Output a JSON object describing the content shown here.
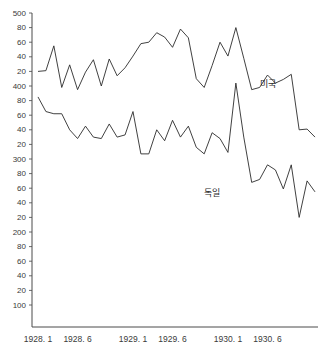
{
  "chart_data": {
    "type": "line",
    "title": "",
    "subtitle": "",
    "xlabel": "",
    "ylabel": "",
    "ylim": [
      100,
      500
    ],
    "xlim": [
      "1928.1",
      "1930.12"
    ],
    "grid": false,
    "legend_position": "inline-annotation",
    "y_ticks": [
      500,
      480,
      460,
      440,
      420,
      400,
      380,
      360,
      340,
      320,
      300,
      280,
      260,
      240,
      220,
      200,
      180,
      160,
      140,
      120,
      100
    ],
    "y_tick_labels": [
      "500",
      "80",
      "60",
      "40",
      "20",
      "400",
      "80",
      "60",
      "40",
      "20",
      "300",
      "80",
      "60",
      "40",
      "20",
      "200",
      "80",
      "60",
      "40",
      "20",
      "100"
    ],
    "x_ticks": [
      "1928. 1",
      "1928. 6",
      "1929. 1",
      "1929. 6",
      "1930. 1",
      "1930. 6"
    ],
    "x_tick_positions": [
      1,
      6,
      13,
      18,
      25,
      30
    ],
    "x_index_range": [
      1,
      36
    ],
    "series": [
      {
        "name": "미국",
        "label": "미국",
        "color": "#2b2b2b",
        "annotation_x": 30,
        "annotation_y": 398,
        "values": [
          420,
          421,
          455,
          398,
          429,
          395,
          419,
          436,
          400,
          437,
          414,
          425,
          441,
          458,
          460,
          473,
          467,
          453,
          478,
          466,
          410,
          398,
          428,
          460,
          441,
          480,
          438,
          395,
          398,
          415,
          404,
          409,
          416,
          340,
          341,
          330
        ]
      },
      {
        "name": "독일",
        "label": "독일",
        "color": "#2b2b2b",
        "annotation_x": 23,
        "annotation_y": 249,
        "values": [
          385,
          365,
          362,
          362,
          340,
          328,
          345,
          330,
          328,
          348,
          330,
          333,
          365,
          307,
          307,
          340,
          325,
          353,
          330,
          345,
          316,
          307,
          336,
          328,
          309,
          404,
          330,
          268,
          272,
          292,
          285,
          259,
          292,
          220,
          270,
          255
        ]
      }
    ]
  },
  "axes": {
    "y_axis_name": "y-axis",
    "x_axis_name": "x-axis"
  }
}
